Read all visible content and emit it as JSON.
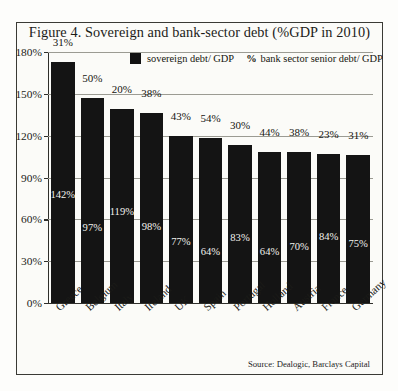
{
  "figure": {
    "title": "Figure 4. Sovereign and bank-sector debt (%GDP in 2010)",
    "source": "Source: Dealogic, Barclays Capital"
  },
  "legend": {
    "swatch_label": "sovereign debt/ GDP",
    "percent_symbol": "%",
    "second_label": "bank sector senior debt/ GDP"
  },
  "chart_data": {
    "type": "bar",
    "subtype": "stacked",
    "title": "Figure 4. Sovereign and bank-sector debt (%GDP in 2010)",
    "xlabel": "",
    "ylabel": "",
    "ylim": [
      0,
      180
    ],
    "yticks": [
      0,
      30,
      60,
      90,
      120,
      150,
      180
    ],
    "ytick_labels": [
      "0%",
      "30%",
      "60%",
      "90%",
      "120%",
      "150%",
      "180%"
    ],
    "grid": true,
    "legend_position": "top-center",
    "categories": [
      "Greece",
      "Belgium",
      "Italy",
      "Ireland",
      "UK",
      "Spain",
      "Portugal",
      "Holland",
      "Austria",
      "France",
      "Germany"
    ],
    "series": [
      {
        "name": "sovereign debt/ GDP",
        "values": [
          142,
          97,
          119,
          98,
          77,
          64,
          83,
          64,
          70,
          84,
          75
        ],
        "labels": [
          "142%",
          "97%",
          "119%",
          "98%",
          "77%",
          "64%",
          "83%",
          "64%",
          "70%",
          "84%",
          "75%"
        ]
      },
      {
        "name": "bank sector senior debt/ GDP",
        "values": [
          31,
          50,
          20,
          38,
          43,
          54,
          30,
          44,
          38,
          23,
          31
        ],
        "labels": [
          "31%",
          "50%",
          "20%",
          "38%",
          "43%",
          "54%",
          "30%",
          "44%",
          "38%",
          "23%",
          "31%"
        ]
      }
    ],
    "totals": [
      173,
      147,
      139,
      136,
      120,
      118,
      113,
      108,
      108,
      107,
      106
    ]
  }
}
